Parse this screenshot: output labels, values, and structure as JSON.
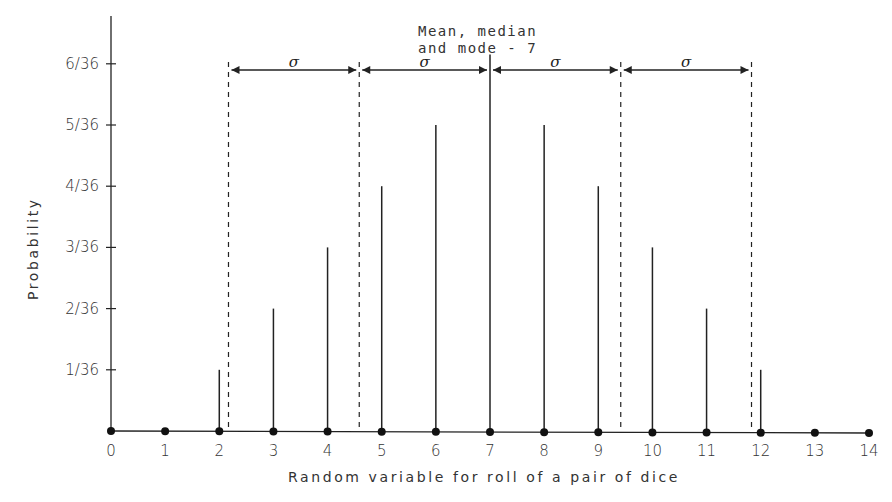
{
  "chart_data": {
    "type": "bar",
    "title": "",
    "xlabel": "Random variable for roll of a pair of dice",
    "ylabel": "Probability",
    "x": [
      0,
      1,
      2,
      3,
      4,
      5,
      6,
      7,
      8,
      9,
      10,
      11,
      12,
      13,
      14
    ],
    "values_over_36": [
      0,
      0,
      1,
      2,
      3,
      4,
      5,
      6,
      5,
      4,
      3,
      2,
      1,
      0,
      0
    ],
    "xlim": [
      0,
      14
    ],
    "ylim_over_36": [
      0,
      6.6
    ],
    "x_tick_labels": [
      "0",
      "1",
      "2",
      "3",
      "4",
      "5",
      "6",
      "7",
      "8",
      "9",
      "10",
      "11",
      "12",
      "13",
      "14"
    ],
    "y_ticks_over_36": [
      1,
      2,
      3,
      4,
      5,
      6
    ],
    "y_tick_labels": [
      "1/36",
      "2/36",
      "3/36",
      "4/36",
      "5/36",
      "6/36"
    ],
    "grid": false,
    "annotation": {
      "lines": [
        "Mean, median",
        "and mode - 7"
      ],
      "x": 7
    },
    "sigma_boundaries": [
      2.17,
      4.585,
      7,
      9.415,
      11.83
    ],
    "sigma_label": "σ",
    "colors": {
      "line": "#222222",
      "text": "#333333",
      "background": "#ffffff"
    }
  }
}
